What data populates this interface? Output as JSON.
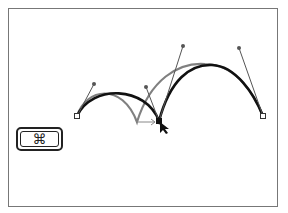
{
  "figure": {
    "colors": {
      "frame": "#777777",
      "new_path": "#111111",
      "original_path": "#808080",
      "handle": "#555555",
      "anchor_fill": "#ffffff",
      "selected_anchor": "#111111"
    },
    "key": {
      "symbol": "⌘",
      "name": "command-key"
    },
    "anchors": [
      {
        "x": 77,
        "y": 116,
        "selected": false
      },
      {
        "x": 159,
        "y": 121,
        "selected": true
      },
      {
        "x": 263,
        "y": 116,
        "selected": false
      }
    ],
    "original_cusp": {
      "x": 137,
      "y": 122
    },
    "handles": [
      {
        "from": [
          77,
          116
        ],
        "to": [
          94,
          84
        ]
      },
      {
        "from": [
          159,
          121
        ],
        "to": [
          146,
          87
        ]
      },
      {
        "from": [
          159,
          121
        ],
        "to": [
          183,
          46
        ]
      },
      {
        "from": [
          263,
          116
        ],
        "to": [
          239,
          48
        ]
      }
    ]
  }
}
